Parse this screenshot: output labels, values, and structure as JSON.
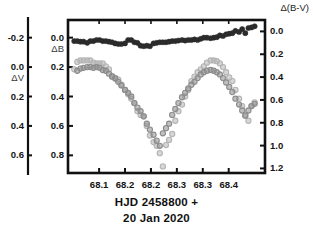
{
  "figure": {
    "caption_line1": "HJD 2458800 +",
    "caption_line2": "20 Jan 2020",
    "corner_label": "Δ(B-V)",
    "left_outer_axis_name": "ΔV",
    "left_inner_axis_name": "ΔB"
  },
  "axes": {
    "x": {
      "label": "HJD 2458800 +",
      "ticks": [
        "68.1",
        "68.2",
        "68.2",
        "68.3",
        "68.3",
        "68.4"
      ],
      "tick_values": [
        68.1,
        68.15,
        68.2,
        68.25,
        68.3,
        68.35
      ],
      "min": 68.04,
      "max": 68.42
    },
    "left_outer": {
      "name": "ΔV",
      "ticks": [
        "-0.2",
        "0.0",
        "0.2",
        "0.4",
        "0.6"
      ],
      "tick_values": [
        -0.2,
        0.0,
        0.2,
        0.4,
        0.6
      ],
      "min": -0.32,
      "max": 0.72
    },
    "left_inner": {
      "name": "ΔB",
      "ticks": [
        "0.0",
        "0.2",
        "0.4",
        "0.6",
        "0.8"
      ],
      "tick_values": [
        0.0,
        0.2,
        0.4,
        0.6,
        0.8
      ],
      "min": -0.12,
      "max": 0.92
    },
    "right": {
      "name": "Δ(B-V)",
      "ticks": [
        "0.0",
        "0.2",
        "0.4",
        "0.6",
        "0.8",
        "1.0",
        "1.2"
      ],
      "tick_values": [
        0.0,
        0.2,
        0.4,
        0.6,
        0.8,
        1.0,
        1.2
      ],
      "min": -0.1,
      "max": 1.24
    }
  },
  "chart_data": {
    "type": "scatter",
    "title": "",
    "xlabel": "HJD 2458800 +",
    "ylabel": "ΔV / ΔB / Δ(B-V)",
    "xlim": [
      68.04,
      68.42
    ],
    "grid": false,
    "legend": "none",
    "right_axis_label": "Δ(B-V)",
    "series": [
      {
        "name": "Δ(B-V)",
        "color": "#2b2b2b",
        "marker": "filled-circle",
        "axis": "right",
        "ylim": [
          -0.1,
          1.24
        ],
        "points": [
          [
            68.052,
            0.085
          ],
          [
            68.058,
            0.085
          ],
          [
            68.064,
            0.09
          ],
          [
            68.07,
            0.09
          ],
          [
            68.077,
            0.1
          ],
          [
            68.083,
            0.085
          ],
          [
            68.089,
            0.085
          ],
          [
            68.095,
            0.075
          ],
          [
            68.101,
            0.075
          ],
          [
            68.107,
            0.085
          ],
          [
            68.113,
            0.085
          ],
          [
            68.119,
            0.09
          ],
          [
            68.125,
            0.095
          ],
          [
            68.131,
            0.105
          ],
          [
            68.137,
            0.11
          ],
          [
            68.143,
            0.11
          ],
          [
            68.15,
            0.105
          ],
          [
            68.156,
            0.075
          ],
          [
            68.162,
            0.075
          ],
          [
            68.168,
            0.095
          ],
          [
            68.174,
            0.1
          ],
          [
            68.18,
            0.125
          ],
          [
            68.186,
            0.13
          ],
          [
            68.192,
            0.125
          ],
          [
            68.198,
            0.13
          ],
          [
            68.205,
            0.105
          ],
          [
            68.211,
            0.1
          ],
          [
            68.217,
            0.095
          ],
          [
            68.223,
            0.095
          ],
          [
            68.229,
            0.095
          ],
          [
            68.235,
            0.09
          ],
          [
            68.241,
            0.085
          ],
          [
            68.247,
            0.085
          ],
          [
            68.253,
            0.08
          ],
          [
            68.26,
            0.075
          ],
          [
            68.266,
            0.08
          ],
          [
            68.272,
            0.075
          ],
          [
            68.278,
            0.075
          ],
          [
            68.284,
            0.07
          ],
          [
            68.29,
            0.075
          ],
          [
            68.296,
            0.065
          ],
          [
            68.302,
            0.055
          ],
          [
            68.308,
            0.055
          ],
          [
            68.315,
            0.06
          ],
          [
            68.321,
            0.055
          ],
          [
            68.327,
            0.05
          ],
          [
            68.333,
            0.035
          ],
          [
            68.339,
            0.04
          ],
          [
            68.345,
            0.025
          ],
          [
            68.351,
            0.02
          ],
          [
            68.357,
            0.015
          ],
          [
            68.363,
            -0.005
          ],
          [
            68.37,
            0.005
          ],
          [
            68.376,
            -0.02
          ],
          [
            68.382,
            0.015
          ],
          [
            68.388,
            -0.03
          ],
          [
            68.394,
            -0.035
          ],
          [
            68.4,
            -0.045
          ]
        ]
      },
      {
        "name": "ΔB",
        "color": "#b4b4b4",
        "marker": "open-circle",
        "axis": "left_inner",
        "ylim": [
          -0.12,
          0.92
        ],
        "points": [
          [
            68.052,
            0.215
          ],
          [
            68.058,
            0.165
          ],
          [
            68.064,
            0.155
          ],
          [
            68.07,
            0.155
          ],
          [
            68.077,
            0.155
          ],
          [
            68.083,
            0.155
          ],
          [
            68.089,
            0.17
          ],
          [
            68.095,
            0.175
          ],
          [
            68.101,
            0.175
          ],
          [
            68.107,
            0.175
          ],
          [
            68.113,
            0.195
          ],
          [
            68.119,
            0.215
          ],
          [
            68.125,
            0.26
          ],
          [
            68.131,
            0.28
          ],
          [
            68.137,
            0.285
          ],
          [
            68.143,
            0.32
          ],
          [
            68.15,
            0.355
          ],
          [
            68.156,
            0.385
          ],
          [
            68.162,
            0.415
          ],
          [
            68.168,
            0.445
          ],
          [
            68.174,
            0.5
          ],
          [
            68.18,
            0.525
          ],
          [
            68.186,
            0.535
          ],
          [
            68.192,
            0.6
          ],
          [
            68.198,
            0.665
          ],
          [
            68.205,
            0.71
          ],
          [
            68.211,
            0.735
          ],
          [
            68.217,
            0.785
          ],
          [
            68.223,
            0.875
          ],
          [
            68.229,
            0.73
          ],
          [
            68.235,
            0.695
          ],
          [
            68.241,
            0.655
          ],
          [
            68.247,
            0.565
          ],
          [
            68.253,
            0.5
          ],
          [
            68.26,
            0.455
          ],
          [
            68.266,
            0.4
          ],
          [
            68.272,
            0.355
          ],
          [
            68.278,
            0.295
          ],
          [
            68.284,
            0.265
          ],
          [
            68.29,
            0.235
          ],
          [
            68.296,
            0.215
          ],
          [
            68.302,
            0.195
          ],
          [
            68.308,
            0.17
          ],
          [
            68.315,
            0.155
          ],
          [
            68.321,
            0.155
          ],
          [
            68.327,
            0.16
          ],
          [
            68.333,
            0.175
          ],
          [
            68.339,
            0.2
          ],
          [
            68.345,
            0.235
          ],
          [
            68.351,
            0.27
          ],
          [
            68.357,
            0.295
          ],
          [
            68.363,
            0.355
          ],
          [
            68.37,
            0.415
          ],
          [
            68.376,
            0.465
          ],
          [
            68.382,
            0.525
          ],
          [
            68.388,
            0.565
          ],
          [
            68.394,
            0.465
          ],
          [
            68.4,
            0.44
          ]
        ]
      },
      {
        "name": "ΔV",
        "color": "#8c8c8c",
        "marker": "open-circle",
        "axis": "left_outer",
        "ylim": [
          -0.32,
          0.72
        ],
        "points": [
          [
            68.058,
            0.025
          ],
          [
            68.064,
            0.01
          ],
          [
            68.07,
            0.005
          ],
          [
            68.077,
            0.0
          ],
          [
            68.083,
            0.0
          ],
          [
            68.089,
            0.005
          ],
          [
            68.095,
            0.0
          ],
          [
            68.101,
            0.005
          ],
          [
            68.107,
            0.02
          ],
          [
            68.113,
            0.025
          ],
          [
            68.119,
            0.045
          ],
          [
            68.125,
            0.065
          ],
          [
            68.131,
            0.075
          ],
          [
            68.137,
            0.1
          ],
          [
            68.143,
            0.125
          ],
          [
            68.15,
            0.155
          ],
          [
            68.156,
            0.175
          ],
          [
            68.162,
            0.2
          ],
          [
            68.168,
            0.245
          ],
          [
            68.174,
            0.275
          ],
          [
            68.18,
            0.3
          ],
          [
            68.186,
            0.335
          ],
          [
            68.192,
            0.385
          ],
          [
            68.198,
            0.425
          ],
          [
            68.205,
            0.46
          ],
          [
            68.211,
            0.5
          ],
          [
            68.217,
            0.535
          ],
          [
            68.223,
            0.45
          ],
          [
            68.229,
            0.415
          ],
          [
            68.235,
            0.385
          ],
          [
            68.241,
            0.325
          ],
          [
            68.247,
            0.285
          ],
          [
            68.253,
            0.245
          ],
          [
            68.26,
            0.205
          ],
          [
            68.266,
            0.175
          ],
          [
            68.272,
            0.145
          ],
          [
            68.278,
            0.12
          ],
          [
            68.284,
            0.1
          ],
          [
            68.29,
            0.075
          ],
          [
            68.296,
            0.05
          ],
          [
            68.302,
            0.035
          ],
          [
            68.308,
            0.025
          ],
          [
            68.315,
            0.02
          ],
          [
            68.321,
            0.025
          ],
          [
            68.327,
            0.035
          ],
          [
            68.333,
            0.05
          ],
          [
            68.339,
            0.075
          ],
          [
            68.345,
            0.105
          ],
          [
            68.351,
            0.135
          ],
          [
            68.357,
            0.17
          ],
          [
            68.363,
            0.215
          ],
          [
            68.37,
            0.255
          ],
          [
            68.376,
            0.295
          ],
          [
            68.382,
            0.33
          ],
          [
            68.388,
            0.295
          ],
          [
            68.394,
            0.265
          ],
          [
            68.4,
            0.25
          ]
        ]
      }
    ]
  }
}
